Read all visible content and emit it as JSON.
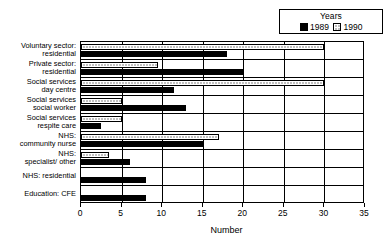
{
  "legend": {
    "title": "Years",
    "entries": [
      {
        "label": "1989",
        "style": "solid",
        "color": "#000000"
      },
      {
        "label": "1990",
        "style": "dotted",
        "color": "#ffffff"
      }
    ]
  },
  "axis": {
    "x_title": "Number",
    "x_ticks": [
      "0",
      "5",
      "10",
      "15",
      "20",
      "25",
      "30",
      "35"
    ]
  },
  "chart_data": {
    "type": "bar",
    "orientation": "horizontal",
    "title": "",
    "xlabel": "Number",
    "ylabel": "",
    "xlim": [
      0,
      35
    ],
    "xticks": [
      0,
      5,
      10,
      15,
      20,
      25,
      30,
      35
    ],
    "grid": true,
    "legend_title": "Years",
    "legend_position": "top-right",
    "categories": [
      "Voluntary sector: residential",
      "Private sector: residential",
      "Social services day centre",
      "Social services social worker",
      "Social services respite care",
      "NHS: community nurse",
      "NHS: specialist/ other",
      "NHS: residential",
      "Education: CFE"
    ],
    "category_lines": [
      [
        "Voluntary sector:",
        "residential"
      ],
      [
        "Private sector:",
        "residential"
      ],
      [
        "Social services",
        "day centre"
      ],
      [
        "Social services",
        "social worker"
      ],
      [
        "Social services",
        "respite care"
      ],
      [
        "NHS:",
        "community nurse"
      ],
      [
        "NHS:",
        "specialist/ other"
      ],
      [
        "NHS: residential",
        ""
      ],
      [
        "Education: CFE",
        ""
      ]
    ],
    "series": [
      {
        "name": "1989",
        "fill": "solid-black",
        "values": [
          18,
          20,
          11.5,
          13,
          2.5,
          15,
          6,
          8,
          8
        ]
      },
      {
        "name": "1990",
        "fill": "dotted-white",
        "values": [
          30,
          9.5,
          30,
          5,
          5,
          17,
          3.5,
          0,
          0
        ]
      }
    ]
  }
}
